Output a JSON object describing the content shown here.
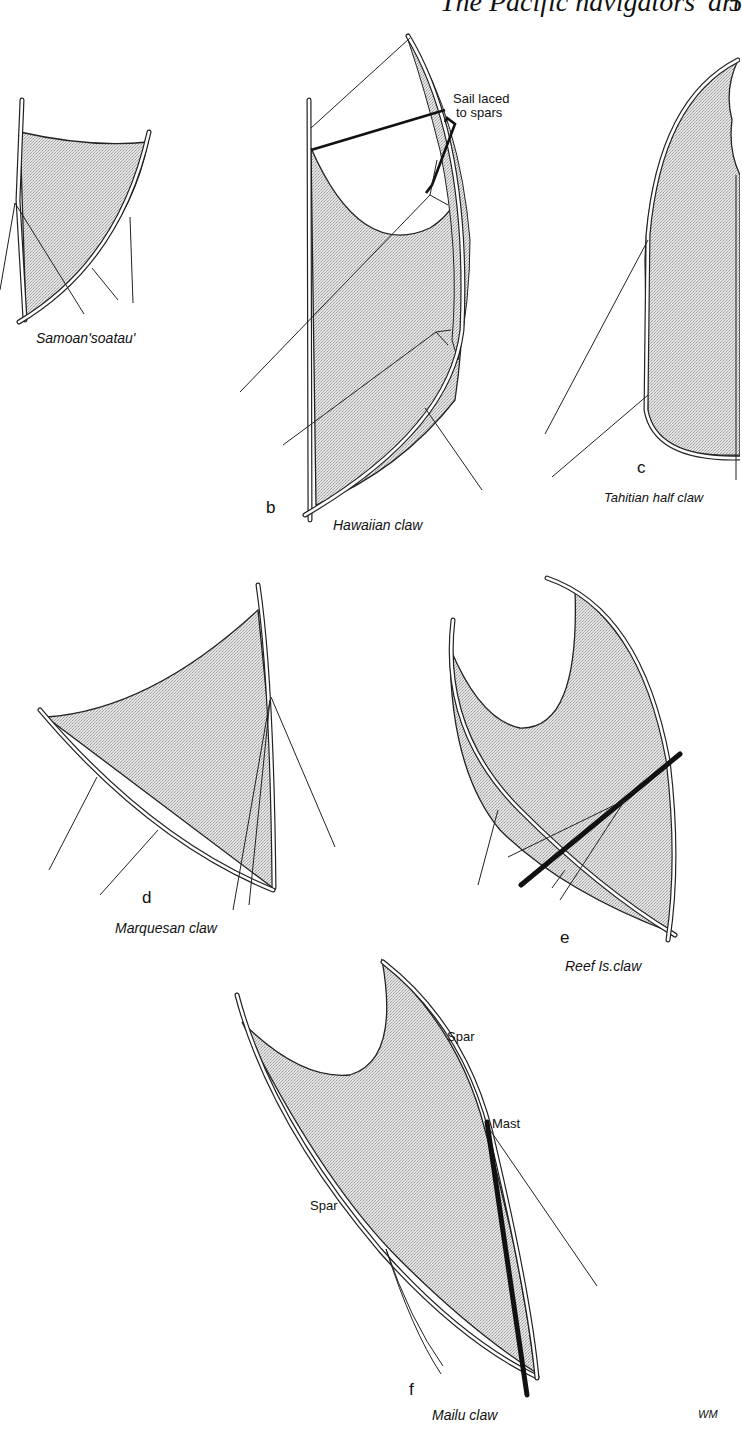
{
  "page": {
    "header": "The Pacific navigators' art",
    "page_number": "5"
  },
  "colors": {
    "ink": "#222222",
    "sail_fill": "#d6d6d6",
    "background": "#ffffff"
  },
  "figures": [
    {
      "letter": "",
      "caption": "Samoan'soatau'"
    },
    {
      "letter": "b",
      "caption": "Hawaiian claw",
      "annotation": "Sail laced\nto spars",
      "annotation_line1": "Sail laced",
      "annotation_line2": "to spars"
    },
    {
      "letter": "c",
      "caption": "Tahitian half claw"
    },
    {
      "letter": "d",
      "caption": "Marquesan claw"
    },
    {
      "letter": "e",
      "caption": "Reef Is.claw"
    },
    {
      "letter": "f",
      "caption": "Mailu claw",
      "labels": [
        "Spar",
        "Mast",
        "Spar"
      ]
    }
  ],
  "signature": "WM"
}
